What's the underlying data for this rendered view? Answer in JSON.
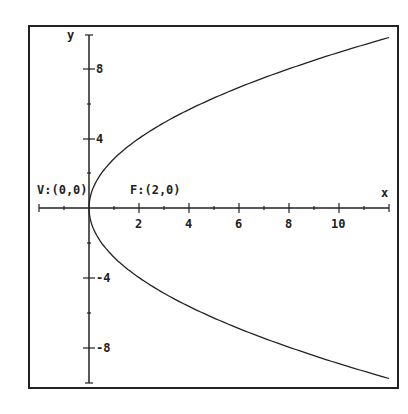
{
  "chart_data": {
    "type": "line",
    "title": "",
    "xlabel": "x",
    "ylabel": "y",
    "equation": "y^2 = 8x",
    "xlim": [
      -2,
      12
    ],
    "ylim": [
      -10,
      10
    ],
    "grid": false,
    "x_ticks": [
      2,
      4,
      6,
      8,
      10
    ],
    "x_tick_labels": [
      "2",
      "4",
      "6",
      "8",
      "10"
    ],
    "y_ticks": [
      8,
      4,
      -4,
      -8
    ],
    "y_tick_labels": [
      "8",
      "4",
      "-4",
      "-8"
    ],
    "annotations": [
      {
        "text": "V:(0,0)",
        "x": 0,
        "y": 0
      },
      {
        "text": "F:(2,0)",
        "x": 2,
        "y": 0
      }
    ],
    "series": [
      {
        "name": "upper branch",
        "x": [
          0,
          0.5,
          1,
          2,
          4,
          6,
          8,
          10,
          12
        ],
        "y": [
          0,
          2,
          2.83,
          4,
          5.66,
          6.93,
          8,
          8.94,
          9.8
        ]
      },
      {
        "name": "lower branch",
        "x": [
          0,
          0.5,
          1,
          2,
          4,
          6,
          8,
          10,
          12
        ],
        "y": [
          0,
          -2,
          -2.83,
          -4,
          -5.66,
          -6.93,
          -8,
          -8.94,
          -9.8
        ]
      }
    ]
  },
  "labels": {
    "x_axis": "x",
    "y_axis": "y",
    "vertex": "V:(0,0)",
    "focus": "F:(2,0)",
    "xt2": "2",
    "xt4": "4",
    "xt6": "6",
    "xt8": "8",
    "xt10": "10",
    "yt8": "8",
    "yt4": "4",
    "ytm4": "-4",
    "ytm8": "-8"
  }
}
